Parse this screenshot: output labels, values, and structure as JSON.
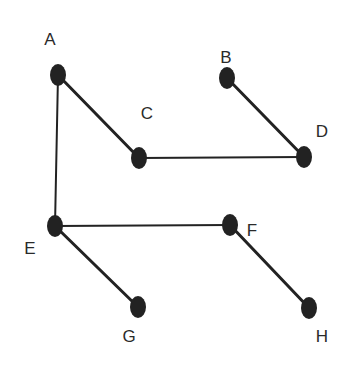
{
  "diagram": {
    "type": "graph",
    "colors": {
      "background": "#ffffff",
      "node_fill": "#222222",
      "edge_stroke": "#222222",
      "label_text": "#2a2a2a"
    },
    "nodes": [
      {
        "id": "A",
        "label": "A",
        "x": 58,
        "y": 75,
        "label_x": 50,
        "label_y": 45
      },
      {
        "id": "B",
        "label": "B",
        "x": 227,
        "y": 78,
        "label_x": 226,
        "label_y": 63
      },
      {
        "id": "C",
        "label": "C",
        "x": 139,
        "y": 158,
        "label_x": 147,
        "label_y": 119
      },
      {
        "id": "D",
        "label": "D",
        "x": 304,
        "y": 157,
        "label_x": 322,
        "label_y": 137
      },
      {
        "id": "E",
        "label": "E",
        "x": 55,
        "y": 226,
        "label_x": 30,
        "label_y": 254
      },
      {
        "id": "F",
        "label": "F",
        "x": 230,
        "y": 225,
        "label_x": 252,
        "label_y": 236
      },
      {
        "id": "G",
        "label": "G",
        "x": 138,
        "y": 307,
        "label_x": 129,
        "label_y": 342
      },
      {
        "id": "H",
        "label": "H",
        "x": 309,
        "y": 308,
        "label_x": 322,
        "label_y": 342
      }
    ],
    "edges": [
      {
        "from": "A",
        "to": "C",
        "width": 3
      },
      {
        "from": "A",
        "to": "E",
        "width": 2
      },
      {
        "from": "C",
        "to": "D",
        "width": 2
      },
      {
        "from": "B",
        "to": "D",
        "width": 3
      },
      {
        "from": "E",
        "to": "F",
        "width": 2
      },
      {
        "from": "E",
        "to": "G",
        "width": 3
      },
      {
        "from": "F",
        "to": "H",
        "width": 3
      }
    ]
  }
}
